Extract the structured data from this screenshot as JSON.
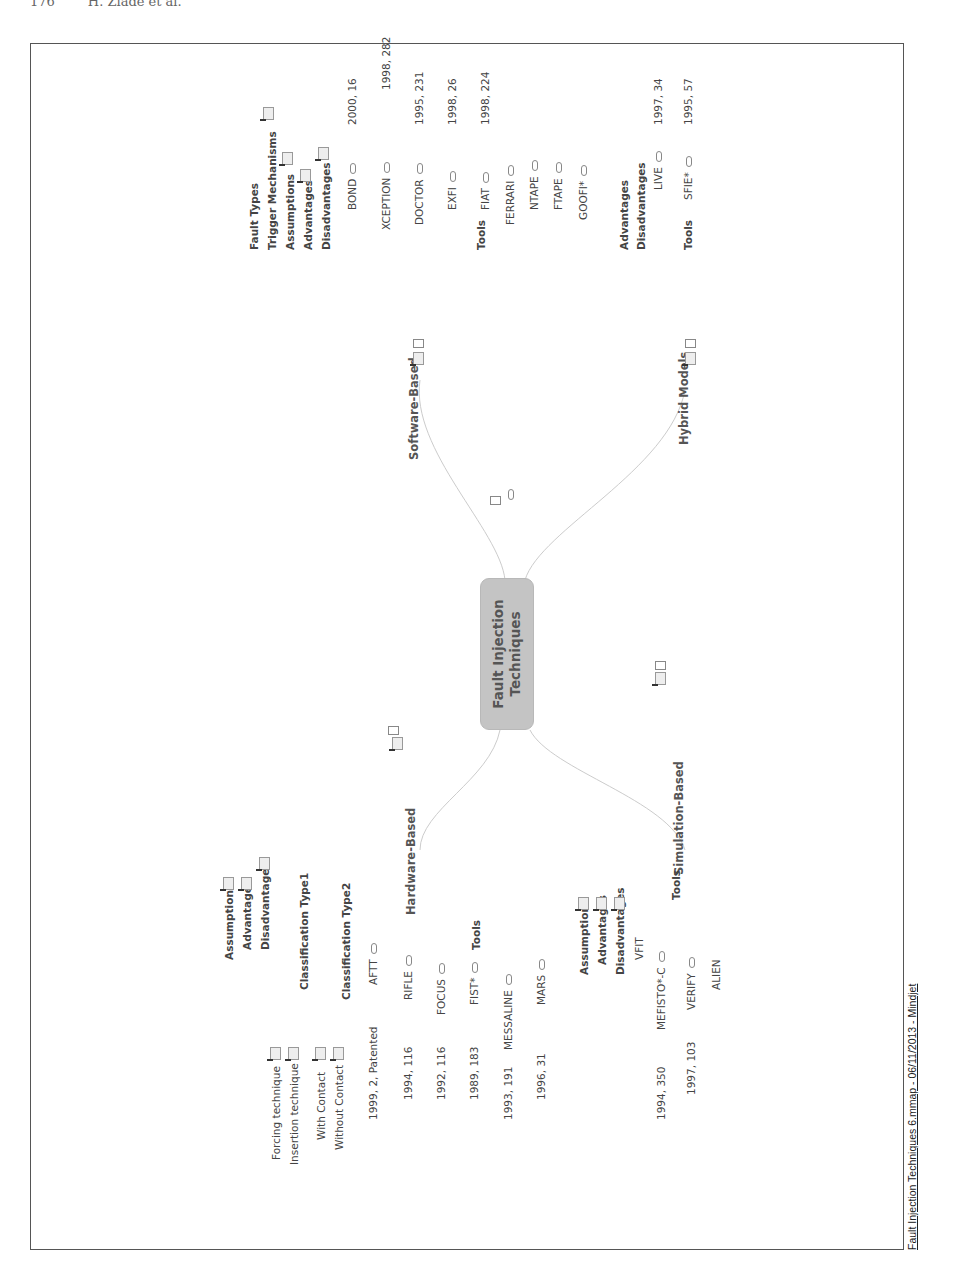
{
  "page_header": "176        H. Ziade et al.",
  "center_node": {
    "line1": "Fault Injection",
    "line2": "Techniques"
  },
  "branches": {
    "hardware": {
      "label": "Hardware-Based",
      "items": [
        "Assumptions",
        "Advantages",
        "Disadvantages"
      ],
      "classification1": {
        "label": "Classification Type1",
        "children": [
          "Forcing technique",
          "Insertion technique"
        ]
      },
      "classification2": {
        "label": "Classification Type2",
        "children": [
          "With Contact",
          "Without Contact"
        ]
      },
      "tools_label": "Tools",
      "tools": [
        {
          "name": "AFTT",
          "ref": "1999, 2, Patented"
        },
        {
          "name": "RIFLE",
          "ref": "1994, 116"
        },
        {
          "name": "FOCUS",
          "ref": "1992, 116"
        },
        {
          "name": "FIST*",
          "ref": "1989, 183"
        },
        {
          "name": "MESSALINE",
          "ref": "1993, 191"
        },
        {
          "name": "MARS",
          "ref": "1996, 31"
        }
      ]
    },
    "software": {
      "label": "Software-Based",
      "items": [
        "Fault Types",
        "Trigger Mechanisms",
        "Assumptions",
        "Advantages",
        "Disadvantages"
      ],
      "tools_label": "Tools",
      "tools": [
        {
          "name": "BOND",
          "ref": "2000, 16"
        },
        {
          "name": "XCEPTION",
          "ref": "1998, 282"
        },
        {
          "name": "DOCTOR",
          "ref": "1995, 231"
        },
        {
          "name": "EXFI",
          "ref": "1998, 26"
        },
        {
          "name": "FIAT",
          "ref": "1998, 224"
        },
        {
          "name": "FERRARI",
          "ref": ""
        },
        {
          "name": "NTAPE",
          "ref": ""
        },
        {
          "name": "FTAPE",
          "ref": ""
        },
        {
          "name": "GOOFI*",
          "ref": ""
        }
      ]
    },
    "simulation": {
      "label": "Simulation-Based",
      "items": [
        "Assumptions",
        "Advantages",
        "Disadvantages"
      ],
      "tools_label": "Tools",
      "tools": [
        {
          "name": "VFIT",
          "ref": ""
        },
        {
          "name": "MEFISTO*-C",
          "ref": "1994, 350"
        },
        {
          "name": "VERIFY",
          "ref": "1997, 103"
        },
        {
          "name": "ALIEN",
          "ref": ""
        }
      ]
    },
    "hybrid": {
      "label": "Hybrid Models",
      "items": [
        "Advantages",
        "Disadvantages"
      ],
      "tools_label": "Tools",
      "tools": [
        {
          "name": "LIVE",
          "ref": "1997, 34"
        },
        {
          "name": "SFIE*",
          "ref": "1995, 57"
        }
      ]
    }
  },
  "footer": "Fault Injection Techniques 6.mmap - 06/11/2013 - Mindjet"
}
